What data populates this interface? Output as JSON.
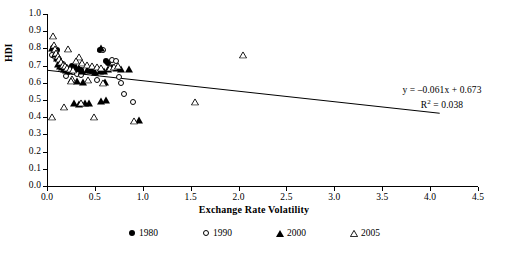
{
  "chart_data": {
    "type": "scatter",
    "title": "",
    "xlabel": "Exchange Rate Volatility",
    "ylabel": "HDI",
    "xlim": [
      0.0,
      4.5
    ],
    "ylim": [
      0.0,
      1.0
    ],
    "grid": false,
    "xticks": [
      "0.0",
      "0.5",
      "1.0",
      "1.5",
      "2.0",
      "2.5",
      "3.0",
      "3.5",
      "4.0",
      "4.5"
    ],
    "xtick_values": [
      0.0,
      0.5,
      1.0,
      1.5,
      2.0,
      2.5,
      3.0,
      3.5,
      4.0,
      4.5
    ],
    "yticks": [
      "0.0",
      "0.1",
      "0.2",
      "0.3",
      "0.4",
      "0.5",
      "0.6",
      "0.7",
      "0.8",
      "0.9",
      "1.0"
    ],
    "ytick_values": [
      0.0,
      0.1,
      0.2,
      0.3,
      0.4,
      0.5,
      0.6,
      0.7,
      0.8,
      0.9,
      1.0
    ],
    "legend_position": "bottom",
    "annotations": {
      "equation": "y = –0.061x + 0.673",
      "r_squared_prefix": "R",
      "r_squared_exponent": "2",
      "r_squared_value": " = 0.038"
    },
    "trendline": {
      "slope": -0.061,
      "intercept": 0.673,
      "r_squared": 0.038,
      "x_start": 0.0,
      "x_end": 4.1,
      "color": "#000000"
    },
    "series": [
      {
        "name": "1980",
        "marker": "filled-circle",
        "color": "#000000",
        "points": [
          [
            0.06,
            0.805
          ],
          [
            0.1,
            0.79
          ],
          [
            0.13,
            0.735
          ],
          [
            0.15,
            0.7
          ],
          [
            0.17,
            0.685
          ],
          [
            0.2,
            0.672
          ],
          [
            0.22,
            0.66
          ],
          [
            0.26,
            0.695
          ],
          [
            0.3,
            0.668
          ],
          [
            0.55,
            0.79
          ],
          [
            0.62,
            0.728
          ],
          [
            0.64,
            0.718
          ],
          [
            0.46,
            0.668
          ],
          [
            0.36,
            0.676
          ]
        ]
      },
      {
        "name": "1990",
        "marker": "open-circle",
        "color": "#000000",
        "points": [
          [
            0.05,
            0.76
          ],
          [
            0.08,
            0.748
          ],
          [
            0.12,
            0.742
          ],
          [
            0.14,
            0.72
          ],
          [
            0.17,
            0.707
          ],
          [
            0.2,
            0.69
          ],
          [
            0.24,
            0.676
          ],
          [
            0.27,
            0.662
          ],
          [
            0.31,
            0.65
          ],
          [
            0.35,
            0.645
          ],
          [
            0.2,
            0.64
          ],
          [
            0.58,
            0.793
          ],
          [
            0.68,
            0.73
          ],
          [
            0.72,
            0.728
          ],
          [
            0.75,
            0.636
          ],
          [
            0.77,
            0.6
          ],
          [
            0.8,
            0.537
          ],
          [
            0.9,
            0.486
          ],
          [
            0.52,
            0.618
          ]
        ]
      },
      {
        "name": "2000",
        "marker": "filled-triangle",
        "color": "#000000",
        "points": [
          [
            0.05,
            0.8
          ],
          [
            0.08,
            0.766
          ],
          [
            0.1,
            0.745
          ],
          [
            0.12,
            0.712
          ],
          [
            0.14,
            0.7
          ],
          [
            0.16,
            0.69
          ],
          [
            0.18,
            0.68
          ],
          [
            0.2,
            0.672
          ],
          [
            0.23,
            0.666
          ],
          [
            0.27,
            0.7
          ],
          [
            0.3,
            0.694
          ],
          [
            0.33,
            0.686
          ],
          [
            0.37,
            0.668
          ],
          [
            0.42,
            0.676
          ],
          [
            0.46,
            0.672
          ],
          [
            0.5,
            0.664
          ],
          [
            0.55,
            0.67
          ],
          [
            0.6,
            0.666
          ],
          [
            0.64,
            0.68
          ],
          [
            0.68,
            0.69
          ],
          [
            0.73,
            0.684
          ],
          [
            0.77,
            0.678
          ],
          [
            0.86,
            0.68
          ],
          [
            0.56,
            0.804
          ],
          [
            0.31,
            0.61
          ],
          [
            0.38,
            0.606
          ],
          [
            0.61,
            0.606
          ],
          [
            0.28,
            0.482
          ],
          [
            0.33,
            0.478
          ],
          [
            0.4,
            0.48
          ],
          [
            0.44,
            0.481
          ],
          [
            0.56,
            0.494
          ],
          [
            0.62,
            0.5
          ],
          [
            0.96,
            0.381
          ]
        ]
      },
      {
        "name": "2005",
        "marker": "open-triangle",
        "color": "#000000",
        "points": [
          [
            0.06,
            0.875
          ],
          [
            0.07,
            0.82
          ],
          [
            0.08,
            0.795
          ],
          [
            0.09,
            0.772
          ],
          [
            0.11,
            0.758
          ],
          [
            0.13,
            0.74
          ],
          [
            0.15,
            0.722
          ],
          [
            0.17,
            0.706
          ],
          [
            0.19,
            0.698
          ],
          [
            0.21,
            0.688
          ],
          [
            0.24,
            0.68
          ],
          [
            0.27,
            0.674
          ],
          [
            0.22,
            0.798
          ],
          [
            0.33,
            0.748
          ],
          [
            0.3,
            0.726
          ],
          [
            0.37,
            0.718
          ],
          [
            0.42,
            0.706
          ],
          [
            0.47,
            0.7
          ],
          [
            0.52,
            0.694
          ],
          [
            0.56,
            0.688
          ],
          [
            0.66,
            0.686
          ],
          [
            0.7,
            0.69
          ],
          [
            0.74,
            0.7
          ],
          [
            0.26,
            0.62
          ],
          [
            0.25,
            0.608
          ],
          [
            0.43,
            0.614
          ],
          [
            0.58,
            0.6
          ],
          [
            0.18,
            0.46
          ],
          [
            0.05,
            0.403
          ],
          [
            0.49,
            0.403
          ],
          [
            0.91,
            0.38
          ],
          [
            1.55,
            0.49
          ],
          [
            2.05,
            0.76
          ],
          [
            0.36,
            0.48
          ]
        ]
      }
    ]
  },
  "legend": {
    "entries": [
      {
        "label": "1980",
        "marker": "filled-circle"
      },
      {
        "label": "1990",
        "marker": "open-circle"
      },
      {
        "label": "2000",
        "marker": "filled-triangle"
      },
      {
        "label": "2005",
        "marker": "open-triangle"
      }
    ]
  }
}
